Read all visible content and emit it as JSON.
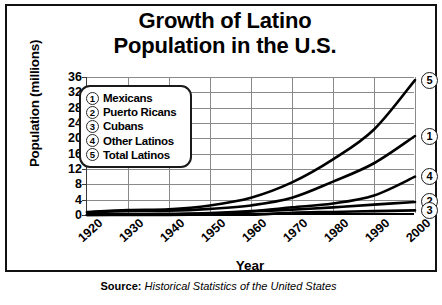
{
  "title": {
    "line1": "Growth of Latino",
    "line2": "Population in the U.S."
  },
  "axes": {
    "y_title": "Population (millions)",
    "x_title": "Year"
  },
  "legend": {
    "items": [
      {
        "key": "1",
        "label": "Mexicans"
      },
      {
        "key": "2",
        "label": "Puerto Ricans"
      },
      {
        "key": "3",
        "label": "Cubans"
      },
      {
        "key": "4",
        "label": "Other Latinos"
      },
      {
        "key": "5",
        "label": "Total Latinos"
      }
    ]
  },
  "source": {
    "label": "Source:",
    "text": "Historical Statistics of the United States"
  },
  "chart_data": {
    "type": "line",
    "title": "Growth of Latino Population in the U.S.",
    "xlabel": "Year",
    "ylabel": "Population (millions)",
    "x": [
      1920,
      1930,
      1940,
      1950,
      1960,
      1970,
      1980,
      1990,
      2000
    ],
    "xlim": [
      1920,
      2000
    ],
    "ylim": [
      0,
      36
    ],
    "yticks": [
      0,
      4,
      8,
      12,
      16,
      20,
      24,
      28,
      32,
      36
    ],
    "xticks": [
      "1920",
      "1930",
      "1940",
      "1950",
      "1960",
      "1970",
      "1980",
      "1990",
      "2000"
    ],
    "grid": true,
    "legend_position": "upper-left-inside",
    "end_markers": [
      "1",
      "2",
      "3",
      "4",
      "5"
    ],
    "series": [
      {
        "name": "Mexicans",
        "key": "1",
        "values": [
          0.7,
          1.0,
          1.1,
          1.6,
          2.5,
          4.5,
          8.7,
          13.5,
          20.6
        ]
      },
      {
        "name": "Puerto Ricans",
        "key": "2",
        "values": [
          0.0,
          0.1,
          0.1,
          0.3,
          0.9,
          1.4,
          2.0,
          2.7,
          3.4
        ]
      },
      {
        "name": "Cubans",
        "key": "3",
        "values": [
          0.0,
          0.0,
          0.0,
          0.1,
          0.1,
          0.6,
          0.8,
          1.0,
          1.2
        ]
      },
      {
        "name": "Other Latinos",
        "key": "4",
        "values": [
          0.1,
          0.2,
          0.3,
          0.5,
          1.0,
          2.0,
          3.0,
          5.1,
          10.0
        ]
      },
      {
        "name": "Total Latinos",
        "key": "5",
        "values": [
          0.8,
          1.3,
          1.5,
          2.5,
          4.5,
          8.5,
          14.5,
          22.3,
          35.2
        ]
      }
    ]
  }
}
